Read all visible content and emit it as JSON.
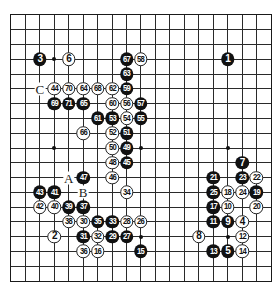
{
  "diagram": {
    "type": "go-game-record",
    "board_size": 19,
    "grid": {
      "x0": 11,
      "y0": 15,
      "dx": 14.44,
      "dy": 14.78
    },
    "colors": {
      "black_stone": "#111111",
      "white_stone": "#ffffff",
      "line": "#2a2a2a"
    },
    "star_points": [
      [
        3,
        3
      ],
      [
        9,
        3
      ],
      [
        15,
        3
      ],
      [
        3,
        9
      ],
      [
        9,
        9
      ],
      [
        15,
        9
      ],
      [
        3,
        15
      ],
      [
        9,
        15
      ],
      [
        15,
        15
      ]
    ],
    "stones": [
      {
        "n": "1",
        "color": "black",
        "c": 15,
        "r": 3
      },
      {
        "n": "2",
        "color": "white",
        "c": 3,
        "r": 15
      },
      {
        "n": "3",
        "color": "black",
        "c": 2,
        "r": 3
      },
      {
        "n": "4",
        "color": "white",
        "c": 16,
        "r": 14
      },
      {
        "n": "5",
        "color": "black",
        "c": 15,
        "r": 16
      },
      {
        "n": "6",
        "color": "white",
        "c": 4,
        "r": 3
      },
      {
        "n": "7",
        "color": "black",
        "c": 16,
        "r": 10
      },
      {
        "n": "8",
        "color": "white",
        "c": 13,
        "r": 15
      },
      {
        "n": "9",
        "color": "black",
        "c": 15,
        "r": 14
      },
      {
        "n": "10",
        "color": "white",
        "c": 15,
        "r": 13
      },
      {
        "n": "11",
        "color": "black",
        "c": 14,
        "r": 14
      },
      {
        "n": "12",
        "color": "white",
        "c": 16,
        "r": 15
      },
      {
        "n": "13",
        "color": "black",
        "c": 14,
        "r": 16
      },
      {
        "n": "14",
        "color": "white",
        "c": 16,
        "r": 16
      },
      {
        "n": "15",
        "color": "black",
        "c": 9,
        "r": 16
      },
      {
        "n": "16",
        "color": "white",
        "c": 6,
        "r": 16
      },
      {
        "n": "17",
        "color": "black",
        "c": 14,
        "r": 13
      },
      {
        "n": "18",
        "color": "white",
        "c": 15,
        "r": 12
      },
      {
        "n": "19",
        "color": "black",
        "c": 17,
        "r": 12
      },
      {
        "n": "20",
        "color": "white",
        "c": 17,
        "r": 13
      },
      {
        "n": "21",
        "color": "black",
        "c": 14,
        "r": 11
      },
      {
        "n": "22",
        "color": "white",
        "c": 17,
        "r": 11
      },
      {
        "n": "23",
        "color": "black",
        "c": 16,
        "r": 11
      },
      {
        "n": "24",
        "color": "white",
        "c": 16,
        "r": 12
      },
      {
        "n": "25",
        "color": "black",
        "c": 14,
        "r": 12
      },
      {
        "n": "26",
        "color": "white",
        "c": 9,
        "r": 14
      },
      {
        "n": "27",
        "color": "black",
        "c": 8,
        "r": 15
      },
      {
        "n": "28",
        "color": "white",
        "c": 8,
        "r": 14
      },
      {
        "n": "29",
        "color": "black",
        "c": 7,
        "r": 15
      },
      {
        "n": "30",
        "color": "white",
        "c": 5,
        "r": 14
      },
      {
        "n": "31",
        "color": "black",
        "c": 5,
        "r": 15
      },
      {
        "n": "32",
        "color": "white",
        "c": 6,
        "r": 15
      },
      {
        "n": "33",
        "color": "black",
        "c": 7,
        "r": 14
      },
      {
        "n": "34",
        "color": "white",
        "c": 8,
        "r": 12
      },
      {
        "n": "35",
        "color": "black",
        "c": 6,
        "r": 14
      },
      {
        "n": "36",
        "color": "white",
        "c": 5,
        "r": 16
      },
      {
        "n": "37",
        "color": "black",
        "c": 5,
        "r": 13
      },
      {
        "n": "38",
        "color": "white",
        "c": 4,
        "r": 14
      },
      {
        "n": "39",
        "color": "black",
        "c": 4,
        "r": 13
      },
      {
        "n": "40",
        "color": "white",
        "c": 3,
        "r": 13
      },
      {
        "n": "41",
        "color": "black",
        "c": 3,
        "r": 12
      },
      {
        "n": "42",
        "color": "white",
        "c": 2,
        "r": 13
      },
      {
        "n": "43",
        "color": "black",
        "c": 2,
        "r": 12
      },
      {
        "n": "44",
        "color": "white",
        "c": 3,
        "r": 5
      },
      {
        "n": "45",
        "color": "black",
        "c": 8,
        "r": 10
      },
      {
        "n": "46",
        "color": "white",
        "c": 7,
        "r": 11
      },
      {
        "n": "47",
        "color": "black",
        "c": 5,
        "r": 11
      },
      {
        "n": "48",
        "color": "white",
        "c": 7,
        "r": 10
      },
      {
        "n": "49",
        "color": "black",
        "c": 8,
        "r": 9
      },
      {
        "n": "50",
        "color": "white",
        "c": 7,
        "r": 9
      },
      {
        "n": "51",
        "color": "black",
        "c": 8,
        "r": 8
      },
      {
        "n": "52",
        "color": "white",
        "c": 7,
        "r": 8
      },
      {
        "n": "53",
        "color": "black",
        "c": 7,
        "r": 7
      },
      {
        "n": "54",
        "color": "white",
        "c": 8,
        "r": 7
      },
      {
        "n": "55",
        "color": "black",
        "c": 9,
        "r": 7
      },
      {
        "n": "56",
        "color": "white",
        "c": 8,
        "r": 6
      },
      {
        "n": "57",
        "color": "black",
        "c": 9,
        "r": 6
      },
      {
        "n": "58",
        "color": "white",
        "c": 9,
        "r": 3
      },
      {
        "n": "59",
        "color": "black",
        "c": 8,
        "r": 5
      },
      {
        "n": "60",
        "color": "white",
        "c": 7,
        "r": 6
      },
      {
        "n": "61",
        "color": "black",
        "c": 6,
        "r": 7
      },
      {
        "n": "62",
        "color": "white",
        "c": 7,
        "r": 5
      },
      {
        "n": "63",
        "color": "black",
        "c": 8,
        "r": 4
      },
      {
        "n": "64",
        "color": "white",
        "c": 5,
        "r": 5
      },
      {
        "n": "65",
        "color": "black",
        "c": 5,
        "r": 6
      },
      {
        "n": "66",
        "color": "white",
        "c": 5,
        "r": 8
      },
      {
        "n": "67",
        "color": "black",
        "c": 8,
        "r": 3
      },
      {
        "n": "68",
        "color": "white",
        "c": 6,
        "r": 5
      },
      {
        "n": "69",
        "color": "black",
        "c": 3,
        "r": 6
      },
      {
        "n": "70",
        "color": "white",
        "c": 4,
        "r": 5
      },
      {
        "n": "71",
        "color": "black",
        "c": 4,
        "r": 6
      }
    ],
    "labels": [
      {
        "text": "A",
        "c": 4,
        "r": 11
      },
      {
        "text": "B",
        "c": 5,
        "r": 12
      },
      {
        "text": "C",
        "c": 2,
        "r": 5
      }
    ]
  }
}
